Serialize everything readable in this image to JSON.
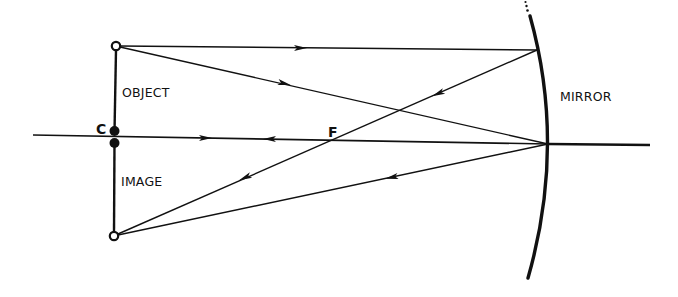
{
  "diagram": {
    "labels": {
      "object": "OBJECT",
      "image": "IMAGE",
      "mirror": "MIRROR",
      "center_of_curvature": "C",
      "focal_point": "F"
    },
    "colors": {
      "line": "#111111",
      "background": "#ffffff"
    },
    "points": {
      "object_top": [
        116,
        46
      ],
      "center_c": [
        114,
        137
      ],
      "image_bottom": [
        114,
        236
      ],
      "focal_point_f": [
        333,
        139
      ],
      "mirror_vertex": [
        548,
        144
      ],
      "mirror_top_strike": [
        537,
        50
      ]
    },
    "rays": [
      {
        "name": "parallel-ray-incident",
        "from": "object_top",
        "to": "mirror_top_strike",
        "arrow": "right"
      },
      {
        "name": "parallel-ray-reflected",
        "from": "mirror_top_strike",
        "to": "image_bottom",
        "via": "focal_point_f",
        "arrow": "left"
      },
      {
        "name": "vertex-ray-incident",
        "from": "object_top",
        "to": "mirror_vertex",
        "arrow": "right"
      },
      {
        "name": "vertex-ray-reflected",
        "from": "mirror_vertex",
        "to": "image_bottom",
        "arrow": "left"
      },
      {
        "name": "principal-axis",
        "from": [
          33,
          135
        ],
        "to": [
          650,
          145
        ],
        "arrows": [
          "right",
          "left"
        ]
      }
    ]
  }
}
